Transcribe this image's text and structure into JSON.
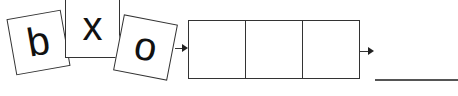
{
  "tiles": [
    {
      "letter": "b",
      "rotation_deg": -10
    },
    {
      "letter": "x",
      "rotation_deg": 0
    },
    {
      "letter": "o",
      "rotation_deg": 11
    }
  ],
  "answer_boxes": {
    "count": 3,
    "values": [
      "",
      "",
      ""
    ]
  },
  "answer_line": {
    "value": ""
  },
  "colors": {
    "stroke": "#333333",
    "background": "#ffffff"
  }
}
